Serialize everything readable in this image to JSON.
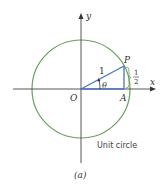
{
  "figure": {
    "caption": "(a)",
    "circle_label": "Unit circle",
    "axes": {
      "x_label": "x",
      "y_label": "y",
      "origin_label": "O"
    },
    "points": {
      "P": "P",
      "A": "A"
    },
    "triangle": {
      "hypotenuse_label": "1",
      "angle_label": "θ",
      "opposite_num": "1",
      "opposite_den": "2"
    },
    "colors": {
      "circle": "#6a9e5e",
      "triangle": "#4a72c4",
      "axis": "#444444"
    }
  }
}
